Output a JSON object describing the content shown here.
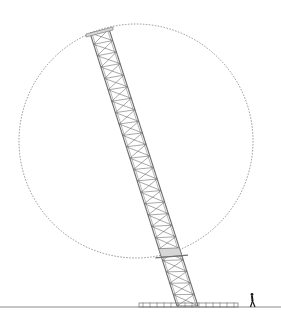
{
  "diagram": {
    "type": "elevation drawing",
    "colors": {
      "background": "#ffffff",
      "line": "#6f6f6f",
      "dashed_circle": "#7a7a7a",
      "ground": "#8a8a8a",
      "human": "#1a1a1a",
      "shade": "#d6d6d6"
    },
    "circle": {
      "cx": 136,
      "cy": 141,
      "r": 117,
      "dash": "1.5 1.5"
    },
    "ground_line": {
      "y": 307,
      "x1": 0,
      "x2": 281
    },
    "base_platform": {
      "x": 139,
      "y": 303,
      "width": 99,
      "height": 4
    },
    "tower": {
      "top_left": [
        90,
        33
      ],
      "top_right": [
        109,
        29
      ],
      "bottom_left": [
        177,
        306
      ],
      "bottom_right": [
        198,
        306
      ],
      "panels": 24
    },
    "crossbar_band": {
      "t": 0.82
    },
    "human": {
      "x": 252,
      "ground_y": 307,
      "height": 14
    }
  }
}
